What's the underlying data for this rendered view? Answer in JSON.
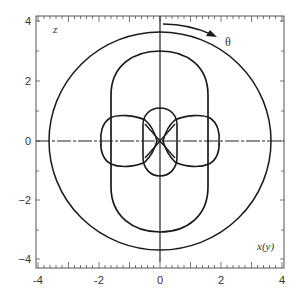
{
  "figure": {
    "type": "polar-lobe-diagram",
    "axes": {
      "x_label": "x(y)",
      "z_label": "z",
      "x_ticks": [
        "-4",
        "-2",
        "0",
        "2",
        "4"
      ],
      "z_ticks": [
        "4",
        "2",
        "0",
        "−2",
        "−4"
      ],
      "x_range": [
        -4,
        4
      ],
      "z_range": [
        -4,
        4
      ]
    },
    "annotation": {
      "angle_label": "θ",
      "arrow": "clockwise from +z axis"
    },
    "curves": [
      {
        "name": "outer-circle",
        "shape": "circle",
        "radius": 3.65
      },
      {
        "name": "vertical-dumbbell",
        "shape": "elongated lobe along z",
        "extent_z": 3.0,
        "half_width_x": 1.6
      },
      {
        "name": "left-lobe",
        "shape": "small lobe",
        "center_x": -1.2,
        "radius": 0.75
      },
      {
        "name": "right-lobe",
        "shape": "small lobe",
        "center_x": 1.2,
        "radius": 0.75
      },
      {
        "name": "central-lobe",
        "shape": "small vertical lobe",
        "extent_z": 1.1,
        "half_width_x": 0.55
      }
    ],
    "colors": {
      "line": "#1a1a1a",
      "frame": "#555555",
      "background": "#ffffff"
    }
  }
}
